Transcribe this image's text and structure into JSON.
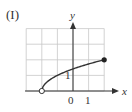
{
  "panel_label": "(I)",
  "chart_data": {
    "type": "line",
    "title": "(I)",
    "xlabel": "x",
    "ylabel": "y",
    "function": "y = sqrt(x + 2)",
    "x_tick_labels": [
      "0",
      "1"
    ],
    "y_tick_labels": [
      "1"
    ],
    "xlim": [
      -3,
      2.9
    ],
    "ylim": [
      0,
      4.4
    ],
    "grid": true,
    "grid_x": [
      -3,
      -2,
      -1,
      0,
      1,
      2
    ],
    "grid_y": [
      0,
      1,
      2,
      3,
      4
    ],
    "series": [
      {
        "name": "f(x)",
        "x": [
          -2,
          -1.75,
          -1.5,
          -1,
          -0.5,
          0,
          0.5,
          1,
          1.5,
          2
        ],
        "y": [
          0,
          0.5,
          0.707,
          1,
          1.225,
          1.414,
          1.581,
          1.732,
          1.871,
          2
        ]
      }
    ],
    "endpoints": [
      {
        "x": -2,
        "y": 0,
        "style": "open"
      },
      {
        "x": 2,
        "y": 2,
        "style": "filled"
      }
    ],
    "colors": {
      "curve": "#333333",
      "grid": "#c8c8c8",
      "axis": "#333333"
    }
  }
}
